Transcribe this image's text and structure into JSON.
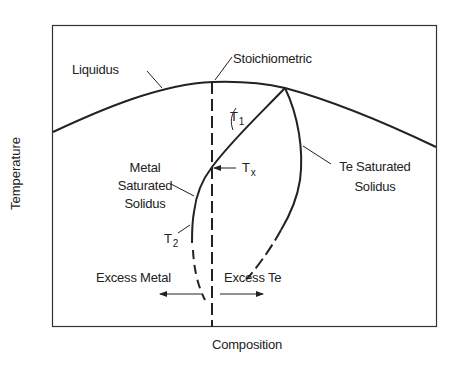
{
  "diagram": {
    "type": "phase-diagram",
    "x_axis_label": "Composition",
    "y_axis_label": "Temperature",
    "labels": {
      "liquidus": "Liquidus",
      "stoichiometric": "Stoichiometric",
      "t1": "T",
      "t1_sub": "1",
      "tx": "T",
      "tx_sub": "x",
      "t2": "T",
      "t2_sub": "2",
      "metal_saturated_solidus_line1": "Metal",
      "metal_saturated_solidus_line2": "Saturated",
      "metal_saturated_solidus_line3": "Solidus",
      "te_saturated_solidus_line1": "Te Saturated",
      "te_saturated_solidus_line2": "Solidus",
      "excess_metal": "Excess Metal",
      "excess_te": "Excess Te"
    },
    "colors": {
      "line": "#222222",
      "frame": "#333333",
      "background": "#ffffff"
    },
    "curves": [
      {
        "name": "Liquidus",
        "style": "solid",
        "description": "Arched curve, maximum at stoichiometric composition"
      },
      {
        "name": "Stoichiometric",
        "style": "dashed vertical line"
      },
      {
        "name": "Metal Saturated Solidus",
        "style": "solid, dashed below T2"
      },
      {
        "name": "Te Saturated Solidus",
        "style": "solid, dashed at low temperature"
      }
    ]
  }
}
